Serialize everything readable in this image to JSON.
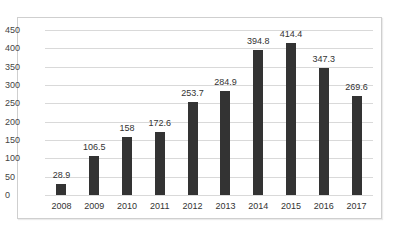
{
  "chart_data": {
    "type": "bar",
    "title": "",
    "xlabel": "",
    "ylabel": "",
    "categories": [
      "2008",
      "2009",
      "2010",
      "2011",
      "2012",
      "2013",
      "2014",
      "2015",
      "2016",
      "2017"
    ],
    "values": [
      28.9,
      106.5,
      158,
      172.6,
      253.7,
      284.9,
      394.8,
      414.4,
      347.3,
      269.6
    ],
    "data_labels": [
      "28.9",
      "106.5",
      "158",
      "172.6",
      "253.7",
      "284.9",
      "394.8",
      "414.4",
      "347.3",
      "269.6"
    ],
    "ylim": [
      0,
      450
    ],
    "yticks": [
      0,
      50,
      100,
      150,
      200,
      250,
      300,
      350,
      400,
      450
    ],
    "ytick_labels": [
      "0",
      "50",
      "100",
      "150",
      "200",
      "250",
      "300",
      "350",
      "400",
      "450"
    ],
    "grid": true,
    "legend": null,
    "bar_color": "#333333"
  }
}
